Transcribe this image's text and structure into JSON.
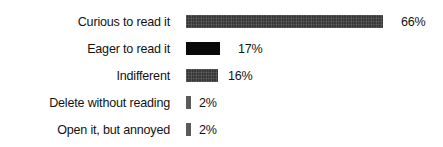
{
  "chart_data": {
    "type": "bar",
    "orientation": "horizontal",
    "title": "",
    "subtitle": "",
    "xlabel": "",
    "ylabel": "",
    "grid": false,
    "legend": null,
    "xlim": [
      0,
      66
    ],
    "categories": [
      "Curious to read it",
      "Eager to read it",
      "Indifferent",
      "Delete without reading",
      "Open it, but annoyed"
    ],
    "values": [
      66,
      17,
      16,
      2,
      2
    ],
    "value_labels": [
      "66%",
      "17%",
      "16%",
      "2%",
      "2%"
    ],
    "unit": "%",
    "bar_colors": [
      "#434343",
      "#090909",
      "#434343",
      "#5a5a5a",
      "#5a5a5a"
    ],
    "bar_pixel_widths": [
      197,
      34,
      32,
      5,
      5
    ],
    "background_color": "#ffffff",
    "text_color": "#121212"
  },
  "rows": [
    {
      "label": "Curious to read it",
      "value_label": "66%",
      "width": 197,
      "style": "textured",
      "gap": 18,
      "top": 8
    },
    {
      "label": "Eager to read it",
      "value_label": "17%",
      "width": 34,
      "style": "solid-black",
      "gap": 18,
      "top": 35
    },
    {
      "label": "Indifferent",
      "value_label": "16%",
      "width": 32,
      "style": "textured",
      "gap": 10,
      "top": 62
    },
    {
      "label": "Delete without reading",
      "value_label": "2%",
      "width": 5,
      "style": "mid-gray",
      "gap": 8,
      "top": 89
    },
    {
      "label": "Open it, but annoyed",
      "value_label": "2%",
      "width": 5,
      "style": "mid-gray",
      "gap": 8,
      "top": 116
    }
  ]
}
